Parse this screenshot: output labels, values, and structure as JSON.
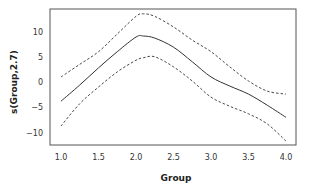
{
  "chart_data": {
    "type": "line",
    "title": "",
    "xlabel": "Group",
    "ylabel": "s(Group,2.7)",
    "xlim": [
      0.87,
      4.13
    ],
    "ylim": [
      -12.5,
      14.5
    ],
    "x_ticks": [
      1.0,
      1.5,
      2.0,
      2.5,
      3.0,
      3.5,
      4.0
    ],
    "x_tick_labels": [
      "1.0",
      "1.5",
      "2.0",
      "2.5",
      "3.0",
      "3.5",
      "4.0"
    ],
    "y_ticks": [
      -10,
      -5,
      0,
      5,
      10
    ],
    "y_tick_labels": [
      "−10",
      "−5",
      "0",
      "5",
      "10"
    ],
    "grid": false,
    "legend": null,
    "x": [
      1.0,
      1.25,
      1.5,
      1.75,
      2.0,
      2.1,
      2.25,
      2.5,
      2.75,
      3.0,
      3.25,
      3.5,
      3.75,
      4.0
    ],
    "series": [
      {
        "name": "upper confidence band",
        "style": "dashed",
        "values": [
          1.0,
          3.5,
          6.0,
          9.5,
          13.0,
          13.5,
          13.0,
          10.9,
          8.3,
          6.0,
          3.0,
          0.2,
          -1.8,
          -2.4
        ]
      },
      {
        "name": "smooth estimate",
        "style": "solid",
        "values": [
          -3.8,
          -0.6,
          2.8,
          6.0,
          8.9,
          9.1,
          8.7,
          6.9,
          4.0,
          1.0,
          -0.8,
          -2.4,
          -4.6,
          -7.0
        ]
      },
      {
        "name": "lower confidence band",
        "style": "dashed",
        "values": [
          -8.7,
          -4.3,
          -1.0,
          2.0,
          4.3,
          4.8,
          5.0,
          3.0,
          0.2,
          -3.0,
          -4.8,
          -6.3,
          -8.3,
          -11.7
        ]
      }
    ]
  },
  "colors": {
    "line": "#333333",
    "frame": "#555555",
    "text": "#333333",
    "background": "#ffffff"
  }
}
